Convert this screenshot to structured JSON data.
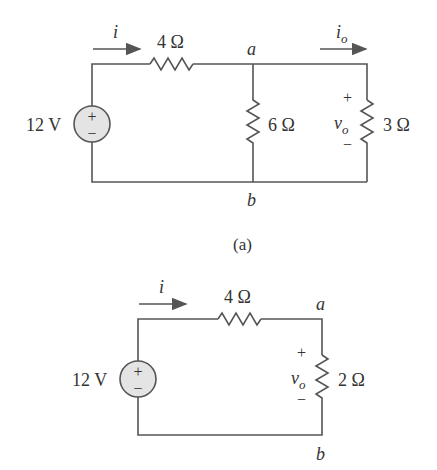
{
  "circuit_a": {
    "caption": "(a)",
    "source": "12 V",
    "source_plus": "+",
    "source_minus": "−",
    "r_series": "4 Ω",
    "r_shunt": "6 Ω",
    "r_load": "3 Ω",
    "current": "i",
    "current_out": "i",
    "current_out_sub": "o",
    "node_a": "a",
    "node_b": "b",
    "vo": "v",
    "vo_sub": "o",
    "vo_plus": "+",
    "vo_minus": "−"
  },
  "circuit_b": {
    "source": "12 V",
    "source_plus": "+",
    "source_minus": "−",
    "r_series": "4 Ω",
    "r_load": "2 Ω",
    "current": "i",
    "node_a": "a",
    "node_b": "b",
    "vo": "v",
    "vo_sub": "o",
    "vo_plus": "+",
    "vo_minus": "−"
  },
  "colors": {
    "wire": "#555555",
    "source_fill": "#e4e4e4",
    "text": "#333333"
  }
}
